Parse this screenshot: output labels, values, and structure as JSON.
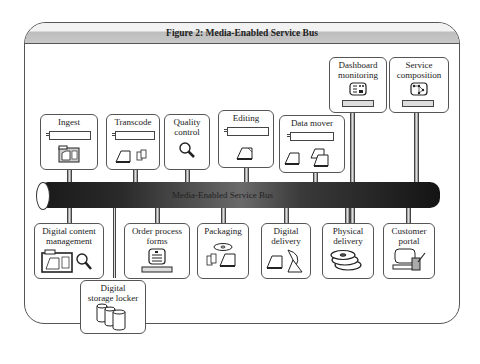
{
  "figure": {
    "title": "Figure 2: Media-Enabled Service Bus"
  },
  "bus": {
    "label": "Media-Enabled Service Bus"
  },
  "top_services": [
    {
      "id": "ingest",
      "label": "Ingest",
      "icon": "media-folder-icon"
    },
    {
      "id": "transcode",
      "label": "Transcode",
      "icon": "document-transform-icon"
    },
    {
      "id": "quality-control",
      "label": "Quality control",
      "line1": "Quality",
      "line2": "control",
      "icon": "magnifier-icon"
    },
    {
      "id": "editing",
      "label": "Editing",
      "icon": "document-icon"
    },
    {
      "id": "data-mover",
      "label": "Data mover",
      "icon": "documents-copy-icon"
    },
    {
      "id": "dashboard-monitoring",
      "label": "Dashboard monitoring",
      "line1": "Dashboard",
      "line2": "monitoring",
      "icon": "dashboard-screen-icon"
    },
    {
      "id": "service-composition",
      "label": "Service composition",
      "line1": "Service",
      "line2": "composition",
      "icon": "workflow-screen-icon"
    }
  ],
  "bottom_services": [
    {
      "id": "digital-content-management",
      "label": "Digital content management",
      "line1": "Digital content",
      "line2": "management",
      "icon": "content-folder-search-icon"
    },
    {
      "id": "digital-storage-locker",
      "label": "Digital storage locker",
      "line1": "Digital",
      "line2": "storage locker",
      "icon": "database-cylinders-icon"
    },
    {
      "id": "order-process-forms",
      "label": "Order process forms",
      "line1": "Order process",
      "line2": "forms",
      "icon": "form-terminal-icon"
    },
    {
      "id": "packaging",
      "label": "Packaging",
      "icon": "disc-package-icon"
    },
    {
      "id": "digital-delivery",
      "label": "Digital delivery",
      "line1": "Digital",
      "line2": "delivery",
      "icon": "satellite-dish-icon"
    },
    {
      "id": "physical-delivery",
      "label": "Physical delivery",
      "line1": "Physical",
      "line2": "delivery",
      "icon": "disc-stack-icon"
    },
    {
      "id": "customer-portal",
      "label": "Customer portal",
      "line1": "Customer",
      "line2": "portal",
      "icon": "computer-tablet-icon"
    }
  ],
  "colors": {
    "border": "#555555",
    "bus_dark": "#141414",
    "bus_mid": "#6a6a6a",
    "header_band": "#c8c8c8"
  }
}
